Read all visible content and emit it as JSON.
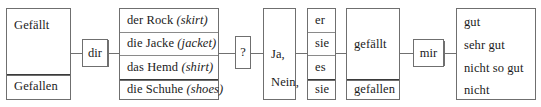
{
  "diagram": {
    "artifact_text": "   ",
    "columns": {
      "verb_stem": {
        "name": "verb-infinitive-column",
        "rows": [
          {
            "label": "Gefällt"
          },
          {
            "label": "Gefallen"
          }
        ]
      },
      "dative_pronoun_1": {
        "name": "dative-pronoun-dir",
        "label": "dir"
      },
      "subjects": {
        "name": "clothing-noun-column",
        "rows": [
          {
            "article": "der",
            "noun": "Rock",
            "gloss": "(skirt)"
          },
          {
            "article": "die",
            "noun": "Jacke",
            "gloss": "(jacket)"
          },
          {
            "article": "das",
            "noun": "Hemd",
            "gloss": "(shirt)"
          },
          {
            "article": "die",
            "noun": "Schuhe",
            "gloss": "(shoes)"
          }
        ]
      },
      "question_mark": {
        "name": "question-mark-box",
        "label": "?"
      },
      "answer": {
        "name": "answer-particle-box",
        "rows": [
          {
            "label": "Ja,"
          },
          {
            "label": "Nein,"
          }
        ]
      },
      "pronouns": {
        "name": "subject-pronoun-column",
        "rows": [
          {
            "label": "er"
          },
          {
            "label": "sie"
          },
          {
            "label": "es"
          },
          {
            "label": "sie"
          }
        ]
      },
      "verbs": {
        "name": "conjugated-verb-column",
        "rows": [
          {
            "label": "gefällt"
          },
          {
            "label": "gefallen"
          }
        ]
      },
      "dative_pronoun_2": {
        "name": "dative-pronoun-mir",
        "label": "mir"
      },
      "adverbs": {
        "name": "degree-adverb-column",
        "rows": [
          {
            "label": "gut"
          },
          {
            "label": "sehr gut"
          },
          {
            "label": "nicht so gut"
          },
          {
            "label": "nicht"
          }
        ]
      }
    },
    "colors": {
      "border": "#6f6f6f",
      "rule": "#8a8a8a",
      "rule_strong": "#3a3a3a",
      "text": "#1b1b1b",
      "background": "#ffffff"
    }
  }
}
